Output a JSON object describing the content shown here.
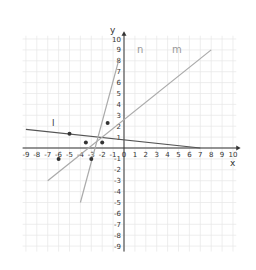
{
  "chart_data": {
    "type": "line",
    "title": "",
    "xlabel": "x",
    "ylabel": "y",
    "xlim": [
      -9,
      10
    ],
    "ylim": [
      -9,
      10
    ],
    "grid": true,
    "x_ticks": [
      "-9",
      "-8",
      "-7",
      "-6",
      "-5",
      "-4",
      "-3",
      "-2",
      "-1",
      "0",
      "1",
      "2",
      "3",
      "4",
      "5",
      "6",
      "7",
      "8",
      "9",
      "10"
    ],
    "y_ticks": [
      "10",
      "9",
      "8",
      "7",
      "6",
      "5",
      "4",
      "3",
      "2",
      "1",
      "-1",
      "-2",
      "-3",
      "-4",
      "-5",
      "-6",
      "-7",
      "-8",
      "-9"
    ],
    "series": [
      {
        "name": "l",
        "points": [
          [
            -9,
            1.7
          ],
          [
            7,
            0
          ]
        ],
        "color": "#555555"
      },
      {
        "name": "m",
        "points": [
          [
            -7,
            -3
          ],
          [
            8,
            9
          ]
        ],
        "color": "#aaaaaa"
      },
      {
        "name": "n",
        "points": [
          [
            -4,
            -5
          ],
          [
            -0.5,
            8
          ]
        ],
        "color": "#aaaaaa"
      }
    ],
    "points": [
      [
        -5,
        1.3
      ],
      [
        -3.5,
        0.5
      ],
      [
        -2,
        0.5
      ],
      [
        -1.5,
        2.3
      ],
      [
        -6,
        -1
      ],
      [
        -3,
        -1
      ]
    ],
    "annotations": [
      "l",
      "m",
      "n"
    ]
  },
  "labels": {
    "x_axis": "x",
    "y_axis": "y",
    "line_l": "l",
    "line_m": "m",
    "line_n": "n"
  }
}
